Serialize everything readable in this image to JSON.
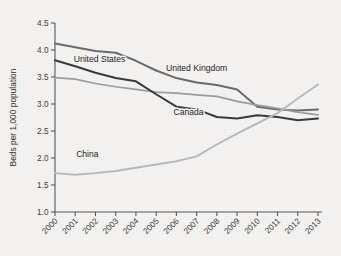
{
  "chart_data": {
    "type": "line",
    "title": "",
    "subtitle": "",
    "xlabel": "",
    "ylabel": "Beds per 1,000 population",
    "x": [
      2000,
      2001,
      2002,
      2003,
      2004,
      2005,
      2006,
      2007,
      2008,
      2009,
      2010,
      2011,
      2012,
      2013
    ],
    "categories": [
      "2000",
      "2001",
      "2002",
      "2003",
      "2004",
      "2005",
      "2006",
      "2007",
      "2008",
      "2009",
      "2010",
      "2011",
      "2012",
      "2013"
    ],
    "xlim": [
      2000,
      2013
    ],
    "ylim": [
      1.0,
      4.5
    ],
    "yticks": [
      "1.0",
      "1.5",
      "2.0",
      "2.5",
      "3.0",
      "3.5",
      "4.0",
      "4.5"
    ],
    "ytick_values": [
      1.0,
      1.5,
      2.0,
      2.5,
      3.0,
      3.5,
      4.0,
      4.5
    ],
    "grid": false,
    "legend": "inline-labels",
    "legend_position": "inline",
    "series": [
      {
        "name": "United Kingdom",
        "color": "#6b6b6d",
        "width": 2.0,
        "values": [
          4.12,
          4.05,
          3.98,
          3.95,
          3.8,
          3.62,
          3.48,
          3.4,
          3.35,
          3.27,
          2.95,
          2.9,
          2.88,
          2.9
        ],
        "label": "United Kingdom",
        "label_x": 2007.0,
        "label_y": 3.62
      },
      {
        "name": "United States",
        "color": "#9c9c9e",
        "width": 1.7,
        "values": [
          3.49,
          3.46,
          3.38,
          3.32,
          3.27,
          3.22,
          3.2,
          3.17,
          3.14,
          3.05,
          2.98,
          2.92,
          2.85,
          2.8
        ],
        "label": "United States",
        "label_x": 2002.2,
        "label_y": 3.78
      },
      {
        "name": "Canada",
        "color": "#3a3a3c",
        "width": 2.0,
        "values": [
          3.81,
          3.7,
          3.58,
          3.48,
          3.42,
          3.18,
          2.95,
          2.9,
          2.76,
          2.73,
          2.79,
          2.76,
          2.7,
          2.73
        ],
        "label": "Canada",
        "label_x": 2006.6,
        "label_y": 2.8
      },
      {
        "name": "China",
        "color": "#b9b9bb",
        "width": 1.9,
        "values": [
          1.72,
          1.69,
          1.72,
          1.76,
          1.82,
          1.88,
          1.94,
          2.03,
          2.25,
          2.45,
          2.64,
          2.83,
          3.1,
          3.36
        ],
        "label": "China",
        "label_x": 2001.6,
        "label_y": 2.02
      }
    ]
  },
  "axes": {
    "y_axis_title": "Beds per 1,000 population"
  }
}
